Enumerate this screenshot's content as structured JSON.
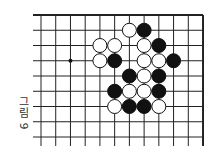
{
  "figure": {
    "caption_word": "그림",
    "caption_number": "9"
  },
  "board": {
    "columns": 12,
    "rows": 9,
    "origin_x": 41,
    "origin_y": 15,
    "spacing_x": 14.73,
    "spacing_y": 15.25,
    "line_left_extent": 33,
    "line_bottom_extent": 146,
    "top_edge": true,
    "right_edge": true,
    "line_color": "#222222",
    "stone_radius": 7,
    "star_points": [
      [
        2,
        3
      ]
    ],
    "stones": [
      {
        "col": 6,
        "row": 1,
        "color": "white"
      },
      {
        "col": 7,
        "row": 1,
        "color": "black"
      },
      {
        "col": 4,
        "row": 2,
        "color": "white"
      },
      {
        "col": 5,
        "row": 2,
        "color": "white"
      },
      {
        "col": 7,
        "row": 2,
        "color": "white"
      },
      {
        "col": 8,
        "row": 2,
        "color": "black"
      },
      {
        "col": 4,
        "row": 3,
        "color": "white"
      },
      {
        "col": 5,
        "row": 3,
        "color": "black"
      },
      {
        "col": 7,
        "row": 3,
        "color": "white"
      },
      {
        "col": 8,
        "row": 3,
        "color": "white"
      },
      {
        "col": 9,
        "row": 3,
        "color": "black"
      },
      {
        "col": 6,
        "row": 4,
        "color": "black"
      },
      {
        "col": 7,
        "row": 4,
        "color": "white"
      },
      {
        "col": 8,
        "row": 4,
        "color": "black"
      },
      {
        "col": 5,
        "row": 5,
        "color": "black"
      },
      {
        "col": 6,
        "row": 5,
        "color": "white"
      },
      {
        "col": 7,
        "row": 5,
        "color": "white"
      },
      {
        "col": 8,
        "row": 5,
        "color": "black"
      },
      {
        "col": 5,
        "row": 6,
        "color": "white"
      },
      {
        "col": 6,
        "row": 6,
        "color": "black"
      },
      {
        "col": 7,
        "row": 6,
        "color": "black"
      },
      {
        "col": 8,
        "row": 6,
        "color": "white"
      }
    ]
  }
}
